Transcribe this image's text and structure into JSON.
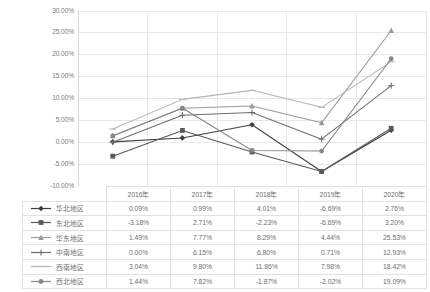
{
  "chart_data": {
    "type": "line",
    "title": "",
    "xlabel": "",
    "ylabel": "",
    "categories": [
      "2016年",
      "2017年",
      "2018年",
      "2019年",
      "2020年"
    ],
    "ylim": [
      -10,
      30
    ],
    "ytick_labels": [
      "30.00%",
      "25.00%",
      "20.00%",
      "15.00%",
      "10.00%",
      "5.00%",
      "0.00%",
      "-5.00%",
      "-10.00%"
    ],
    "ytick_values": [
      30,
      25,
      20,
      15,
      10,
      5,
      0,
      -5,
      -10
    ],
    "grid": true,
    "legend_position": "table-below",
    "value_suffix": "%",
    "series": [
      {
        "name": "华北地区",
        "marker": "diamond",
        "color": "#3f3f3f",
        "values": [
          0.09,
          0.99,
          4.01,
          -6.69,
          2.76
        ],
        "labels": [
          "0.09%",
          "0.99%",
          "4.01%",
          "-6.69%",
          "2.76%"
        ]
      },
      {
        "name": "东北地区",
        "marker": "square",
        "color": "#595959",
        "values": [
          -3.18,
          2.71,
          -2.23,
          -6.69,
          3.2
        ],
        "labels": [
          "-3.18%",
          "2.71%",
          "-2.23%",
          "-6.69%",
          "3.20%"
        ]
      },
      {
        "name": "华东地区",
        "marker": "triangle",
        "color": "#9a9a9a",
        "values": [
          1.49,
          7.77,
          8.29,
          4.44,
          25.53
        ],
        "labels": [
          "1.49%",
          "7.77%",
          "8.29%",
          "4.44%",
          "25.53%"
        ]
      },
      {
        "name": "中南地区",
        "marker": "cross",
        "color": "#6e6e6e",
        "values": [
          0.0,
          6.15,
          6.8,
          0.71,
          12.93
        ],
        "labels": [
          "0.00%",
          "6.15%",
          "6.80%",
          "0.71%",
          "12.93%"
        ]
      },
      {
        "name": "西南地区",
        "marker": "line",
        "color": "#b5b5b5",
        "values": [
          3.04,
          9.8,
          11.86,
          7.98,
          18.42
        ],
        "labels": [
          "3.04%",
          "9.80%",
          "11.86%",
          "7.98%",
          "18.42%"
        ]
      },
      {
        "name": "西北地区",
        "marker": "circle",
        "color": "#888888",
        "values": [
          1.44,
          7.82,
          -1.87,
          -2.02,
          19.09
        ],
        "labels": [
          "1.44%",
          "7.82%",
          "-1.87%",
          "-2.02%",
          "19.09%"
        ]
      }
    ]
  },
  "table": {
    "corner_label": "",
    "columns": [
      "2016年",
      "2017年",
      "2018年",
      "2019年",
      "2020年"
    ]
  },
  "colors": {
    "grid": "#e8e8e8",
    "axis": "#d9d9d9",
    "text": "#6f6f6f",
    "table_border": "#e2e2e2",
    "background": "#ffffff"
  }
}
